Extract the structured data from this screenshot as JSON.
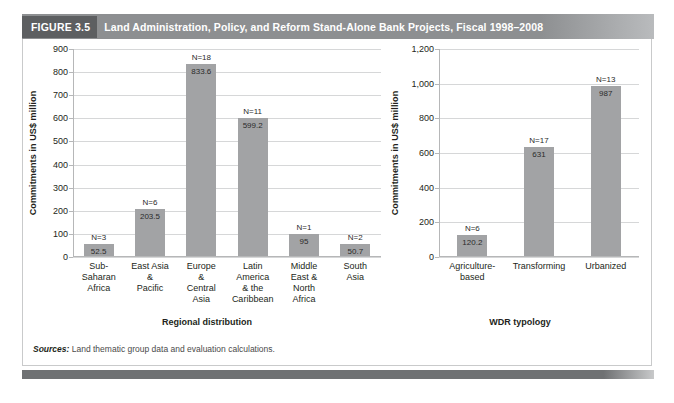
{
  "header": {
    "tag": "FIGURE 3.5",
    "title": "Land Administration, Policy, and Reform Stand-Alone Bank Projects, Fiscal 1998–2008"
  },
  "sources": {
    "label": "Sources:",
    "text": " Land thematic group data and evaluation calculations."
  },
  "colors": {
    "bar": "#a2a3a5",
    "header_bar": "#8d8f91",
    "header_tag": "#5d5f61",
    "grid": "#d6d7d8",
    "footer": "#6f7173"
  },
  "chart_data": [
    {
      "type": "bar",
      "title": "",
      "xlabel": "Regional distribution",
      "ylabel": "Commitments in US$ million",
      "ylim": [
        0,
        900
      ],
      "yticks": [
        0,
        100,
        200,
        300,
        400,
        500,
        600,
        700,
        800,
        900
      ],
      "ytick_labels": [
        "0",
        "100",
        "200",
        "300",
        "400",
        "500",
        "600",
        "700",
        "800",
        "900"
      ],
      "grid": true,
      "legend": "none",
      "categories": [
        "Sub-\nSaharan\nAfrica",
        "East Asia\n&\nPacific",
        "Europe\n&\nCentral\nAsia",
        "Latin\nAmerica\n& the\nCaribbean",
        "Middle\nEast &\nNorth\nAfrica",
        "South\nAsia"
      ],
      "values": [
        52.5,
        203.5,
        833.6,
        599.2,
        95,
        50.7
      ],
      "value_labels": [
        "52.5",
        "203.5",
        "833.6",
        "599.2",
        "95",
        "50.7"
      ],
      "counts": [
        "N=3",
        "N=6",
        "N=18",
        "N=11",
        "N=1",
        "N=2"
      ]
    },
    {
      "type": "bar",
      "title": "",
      "xlabel": "WDR typology",
      "ylabel": "Commitments in US$ million",
      "ylim": [
        0,
        1200
      ],
      "yticks": [
        0,
        200,
        400,
        600,
        800,
        1000,
        1200
      ],
      "ytick_labels": [
        "0",
        "200",
        "400",
        "600",
        "800",
        "1,000",
        "1,200"
      ],
      "grid": true,
      "legend": "none",
      "categories": [
        "Agriculture-\nbased",
        "Transforming",
        "Urbanized"
      ],
      "values": [
        120.2,
        631,
        987
      ],
      "value_labels": [
        "120.2",
        "631",
        "987"
      ],
      "counts": [
        "N=6",
        "N=17",
        "N=13"
      ]
    }
  ]
}
